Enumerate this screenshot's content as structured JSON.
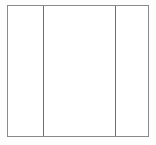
{
  "diagram": {
    "canvas": {
      "width": 156,
      "height": 145,
      "background_color": "#fdfdfd"
    },
    "frame": {
      "x": 7,
      "y": 5,
      "width": 142,
      "height": 132,
      "fill_color": "#ffffff",
      "border_color": "#8a8a8a",
      "border_width": 1
    },
    "divider_color": "#6e6e6e",
    "divider_width": 1,
    "divider_positions": [
      42,
      114
    ],
    "panels": [
      {
        "name": "left-panel",
        "label": "",
        "content": "",
        "width": 35,
        "fill_color": "#ffffff"
      },
      {
        "name": "center-panel",
        "label": "",
        "content": "",
        "width": 72,
        "fill_color": "#ffffff"
      },
      {
        "name": "right-panel",
        "label": "",
        "content": "",
        "width": 33,
        "fill_color": "#ffffff"
      }
    ]
  }
}
